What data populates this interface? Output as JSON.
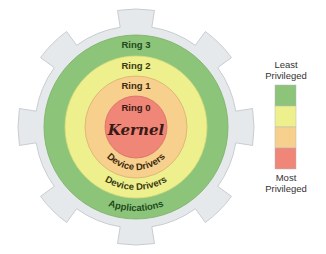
{
  "diagram": {
    "center": {
      "x": 136,
      "y": 127
    },
    "gear": {
      "body_radius": 101,
      "tooth_radius": 118,
      "tooth_count": 8,
      "fill": "#e6e9ec",
      "stroke": "#c9cdd1"
    },
    "rings": [
      {
        "id": "ring3",
        "label": "Ring 3",
        "role": "Applications",
        "radius": 92,
        "fill": "#8cc47a",
        "stroke": "#7ab067",
        "text_color": "#1f4a1a"
      },
      {
        "id": "ring2",
        "label": "Ring 2",
        "role": "Device Drivers",
        "radius": 71,
        "fill": "#eef08e",
        "stroke": "#d8da78",
        "text_color": "#3b3a12"
      },
      {
        "id": "ring1",
        "label": "Ring 1",
        "role": "Device Drivers",
        "radius": 51,
        "fill": "#f8d08e",
        "stroke": "#d9ae6e",
        "text_color": "#3d2a10"
      },
      {
        "id": "ring0",
        "label": "Ring 0",
        "role": "Kernel",
        "radius": 31,
        "fill": "#ef8678",
        "stroke": "#d66f62",
        "text_color": "#3a1a14"
      }
    ]
  },
  "labels": {
    "ring3": "Ring 3",
    "ring2": "Ring 2",
    "ring1": "Ring 1",
    "ring0": "Ring 0",
    "kernel": "Kernel",
    "ring1_role": "Device Drivers",
    "ring2_role": "Device Drivers",
    "ring3_role": "Applications"
  },
  "legend": {
    "top_label_line1": "Least",
    "top_label_line2": "Privileged",
    "bottom_label_line1": "Most",
    "bottom_label_line2": "Privileged",
    "swatches": [
      {
        "name": "least-privileged",
        "color": "#8cc47a"
      },
      {
        "name": "low-privileged",
        "color": "#eef08e"
      },
      {
        "name": "high-privileged",
        "color": "#f8d08e"
      },
      {
        "name": "most-privileged",
        "color": "#ef8678"
      }
    ]
  }
}
